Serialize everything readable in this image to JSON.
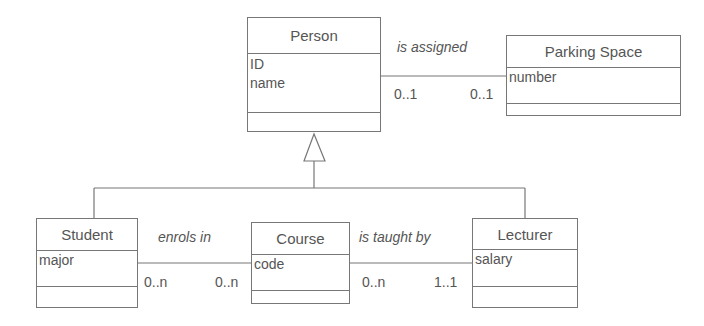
{
  "classes": {
    "person": {
      "name": "Person",
      "attributes": [
        "ID",
        "name"
      ]
    },
    "parking": {
      "name": "Parking Space",
      "attributes": [
        "number"
      ]
    },
    "student": {
      "name": "Student",
      "attributes": [
        "major"
      ]
    },
    "course": {
      "name": "Course",
      "attributes": [
        "code"
      ]
    },
    "lecturer": {
      "name": "Lecturer",
      "attributes": [
        "salary"
      ]
    }
  },
  "associations": {
    "assigned": {
      "label": "is assigned",
      "left_mult": "0..1",
      "right_mult": "0..1"
    },
    "enrols": {
      "label": "enrols in",
      "left_mult": "0..n",
      "right_mult": "0..n"
    },
    "taught": {
      "label": "is taught by",
      "left_mult": "0..n",
      "right_mult": "1..1"
    }
  },
  "colors": {
    "line": "#777777",
    "text": "#555555"
  }
}
